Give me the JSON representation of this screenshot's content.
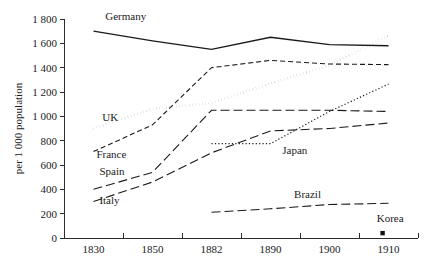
{
  "chart_data": {
    "type": "line",
    "title": "",
    "xlabel": "",
    "ylabel": "per 1 000 population",
    "x": [
      1830,
      1850,
      1882,
      1890,
      1900,
      1910
    ],
    "xtick_labels": [
      "1830",
      "1850",
      "1882",
      "1890",
      "1900",
      "1910"
    ],
    "ytick_labels": [
      "0",
      "200",
      "400",
      "600",
      "800",
      "1 000",
      "1 200",
      "1 400",
      "1 600",
      "1 800"
    ],
    "ytick_values": [
      0,
      200,
      400,
      600,
      800,
      1000,
      1200,
      1400,
      1600,
      1800
    ],
    "ylim": [
      0,
      1800
    ],
    "grid": false,
    "legend": "inline-labels",
    "series": [
      {
        "name": "Germany",
        "label": "Germany",
        "style": "solid",
        "x": [
          1830,
          1850,
          1882,
          1890,
          1900,
          1910
        ],
        "values": [
          1700,
          1620,
          1550,
          1650,
          1590,
          1580
        ],
        "label_x": 1834,
        "label_y": 1790
      },
      {
        "name": "UK",
        "label": "UK",
        "style": "thick-dotted",
        "x": [
          1830,
          1850,
          1882,
          1890,
          1900,
          1910
        ],
        "values": [
          900,
          1060,
          1110,
          1270,
          1420,
          1665
        ],
        "label_x": 1833,
        "label_y": 960
      },
      {
        "name": "France",
        "label": "France",
        "style": "dashed",
        "x": [
          1830,
          1850,
          1882,
          1890,
          1900,
          1910
        ],
        "values": [
          710,
          930,
          1400,
          1460,
          1430,
          1425
        ],
        "label_x": 1831,
        "label_y": 660
      },
      {
        "name": "Spain",
        "label": "Spain",
        "style": "long-dashed",
        "x": [
          1830,
          1850,
          1882,
          1890,
          1900,
          1910
        ],
        "values": [
          400,
          540,
          1050,
          1050,
          1050,
          1040
        ],
        "label_x": 1832,
        "label_y": 520
      },
      {
        "name": "Italy",
        "label": "Italy",
        "style": "long-dashed",
        "x": [
          1830,
          1850,
          1882,
          1890,
          1900,
          1910
        ],
        "values": [
          300,
          460,
          700,
          880,
          900,
          945
        ],
        "label_x": 1832,
        "label_y": 280
      },
      {
        "name": "Japan",
        "label": "Japan",
        "style": "fine-dotted",
        "x": [
          1882,
          1890,
          1900,
          1910
        ],
        "values": [
          775,
          775,
          1040,
          1265
        ],
        "label_x": 1892,
        "label_y": 690
      },
      {
        "name": "Brazil",
        "label": "Brazil",
        "style": "long-dashed",
        "x": [
          1882,
          1890,
          1900,
          1910
        ],
        "values": [
          212,
          240,
          275,
          285
        ],
        "label_x": 1894,
        "label_y": 330
      },
      {
        "name": "Korea",
        "label": "Korea",
        "style": "point",
        "x": [
          1909
        ],
        "values": [
          40
        ],
        "label_x": 1908,
        "label_y": 130
      }
    ]
  },
  "colors": {
    "ink": "#1a1a1a",
    "axis": "#2b2b2b",
    "background": "#ffffff"
  }
}
